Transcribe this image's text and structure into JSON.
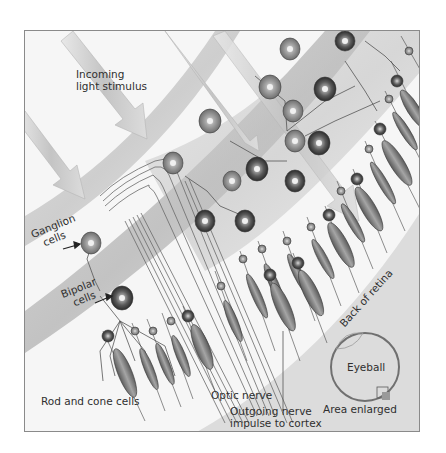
{
  "figure": {
    "colors": {
      "background": "#f4f4f4",
      "band": "#c9c9c9",
      "cell_dark": "#3c3c3c",
      "cell_mid": "#8f8f8f",
      "arrow": "#cfcfcf",
      "frame": "#8a8a8a",
      "text": "#2f2f2f"
    },
    "labels": {
      "incoming_light": [
        "Incoming",
        "light stimulus"
      ],
      "ganglion": [
        "Ganglion",
        "cells"
      ],
      "bipolar": [
        "Bipolar",
        "cells"
      ],
      "rod_cone": "Rod and cone cells",
      "optic_nerve": "Optic nerve",
      "outgoing": [
        "Outgoing nerve",
        "impulse to cortex"
      ],
      "back_of_retina": "Back of retina",
      "eyeball": "Eyeball",
      "area_enlarged": "Area enlarged"
    },
    "icons": [
      "light-arrow-icon",
      "ganglion-cell-icon",
      "bipolar-cell-icon",
      "rod-cell-icon",
      "cone-cell-icon",
      "eyeball-icon",
      "pointer-arrow-icon"
    ]
  }
}
